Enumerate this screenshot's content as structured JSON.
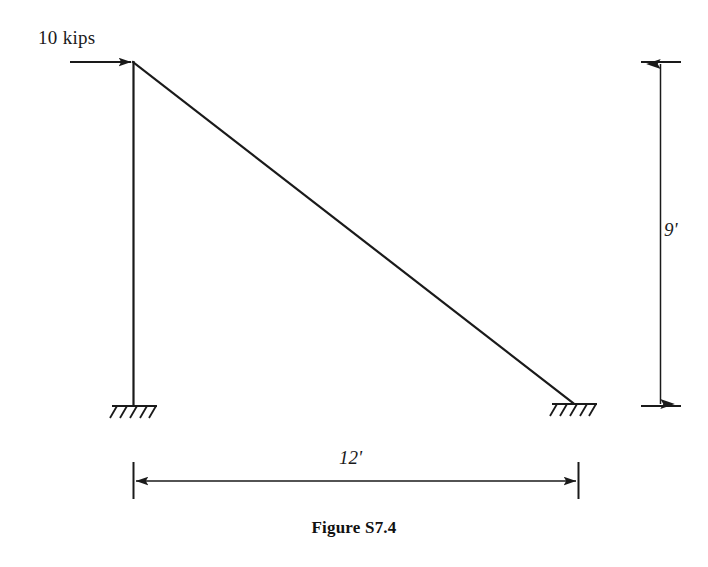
{
  "figure": {
    "caption": "Figure S7.4",
    "type": "structural-frame-diagram"
  },
  "load": {
    "label": "10 kips",
    "magnitude": 10,
    "unit": "kips",
    "direction": "horizontal-right",
    "applied_at": "top-joint"
  },
  "dimensions": {
    "vertical": {
      "label": "9'",
      "value": 9,
      "unit": "ft",
      "orientation": "vertical"
    },
    "horizontal": {
      "label": "12'",
      "value": 12,
      "unit": "ft",
      "orientation": "horizontal"
    }
  },
  "members": {
    "column": {
      "name": "vertical-column",
      "from": [
        133,
        62
      ],
      "to": [
        133,
        405
      ]
    },
    "diagonal": {
      "name": "inclined-member",
      "from": [
        133,
        62
      ],
      "to": [
        573,
        403
      ]
    }
  },
  "supports": {
    "left": {
      "name": "left-fixed-support",
      "x": 133,
      "y": 405,
      "type": "fixed-hatched"
    },
    "right": {
      "name": "right-fixed-support",
      "x": 573,
      "y": 403,
      "type": "fixed-hatched"
    }
  },
  "colors": {
    "line": "#1a1a1a",
    "background": "#ffffff"
  }
}
